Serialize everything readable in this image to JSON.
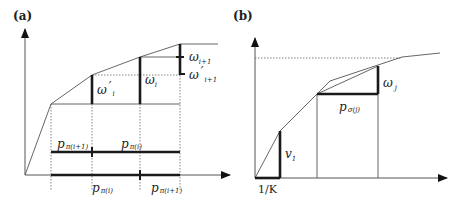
{
  "panels": {
    "a": {
      "label": "(a)",
      "omega_prime_i": {
        "main": "ω",
        "prime": "′",
        "sub": "i"
      },
      "omega_i": {
        "main": "ω",
        "sub": "i"
      },
      "omega_i1": {
        "main": "ω",
        "sub": "i+1"
      },
      "omega_prime_i1": {
        "main": "ω",
        "prime": "′",
        "sub": "i+1"
      },
      "p_pi_i1_top": {
        "main": "p",
        "sub": "π(i+1)"
      },
      "p_pi_i_top": {
        "main": "p",
        "sub": "π(i)"
      },
      "p_pi_i_bottom": {
        "main": "p",
        "sub": "π(i)"
      },
      "p_pi_i1_bottom": {
        "main": "p",
        "sub": "π(i+1)"
      }
    },
    "b": {
      "label": "(b)",
      "omega_j": {
        "main": "ω",
        "sub": "j"
      },
      "p_sigma_j": {
        "main": "p",
        "sub": "σ(j)"
      },
      "v1": {
        "main": "v",
        "sub": "1"
      },
      "one_over_k": "1/K"
    }
  }
}
